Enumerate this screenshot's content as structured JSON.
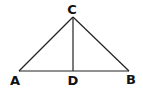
{
  "diagram": {
    "type": "triangle-with-altitude",
    "stroke_color": "#222222",
    "label_color": "#111111",
    "points": {
      "A": {
        "label": "A",
        "x": 19,
        "y": 71,
        "lx": 15,
        "ly": 85
      },
      "B": {
        "label": "B",
        "x": 129,
        "y": 71,
        "lx": 131,
        "ly": 84
      },
      "C": {
        "label": "C",
        "x": 73,
        "y": 17,
        "lx": 72,
        "ly": 14
      },
      "D": {
        "label": "D",
        "x": 73,
        "y": 71,
        "lx": 73,
        "ly": 85
      }
    },
    "segments": [
      {
        "from": "A",
        "to": "C"
      },
      {
        "from": "C",
        "to": "B"
      },
      {
        "from": "A",
        "to": "B"
      },
      {
        "from": "C",
        "to": "D"
      }
    ]
  }
}
